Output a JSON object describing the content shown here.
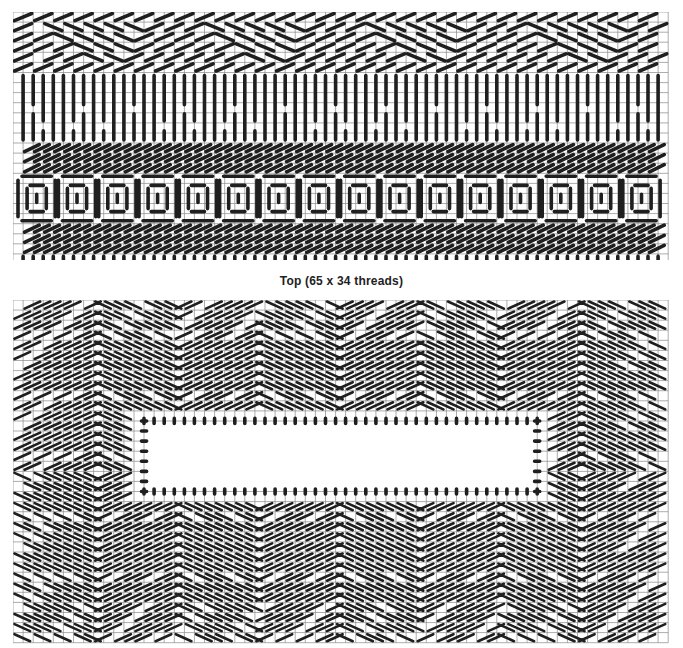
{
  "charts": [
    {
      "id": "top",
      "caption": "Top (65 x 34 threads)",
      "cols": 65,
      "rows": 25,
      "cell": 10.08,
      "bands": [
        {
          "type": "diag-chevron",
          "rows": [
            0,
            6
          ]
        },
        {
          "type": "vertical-long",
          "rows": [
            6,
            13
          ]
        },
        {
          "type": "diag-right",
          "rows": [
            13,
            16
          ]
        },
        {
          "type": "square-motifs",
          "rows": [
            16,
            21
          ],
          "count": 16
        },
        {
          "type": "diag-right",
          "rows": [
            21,
            24
          ]
        },
        {
          "type": "edge-dots",
          "rows": [
            24,
            25
          ]
        }
      ]
    },
    {
      "id": "side",
      "caption": "",
      "cols": 65,
      "rows": 34,
      "cell": 10.08,
      "opening": {
        "col_start": 13,
        "col_end": 52,
        "row_start": 12,
        "row_end": 19
      }
    }
  ],
  "colors": {
    "grid": "#8a8a8a",
    "stitch": "#1f1f1f",
    "background": "#ffffff"
  }
}
